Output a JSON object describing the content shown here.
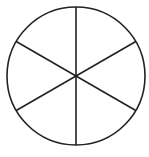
{
  "diagram": {
    "type": "circle-divided-into-sectors",
    "sectors": 6,
    "center": [
      76,
      76
    ],
    "radius": 69,
    "stroke_color": "#222222",
    "fill_color": "#ffffff",
    "stroke_width": 1.6
  }
}
